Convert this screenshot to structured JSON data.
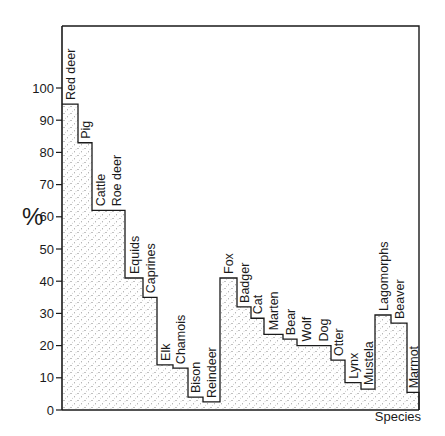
{
  "chart_data": {
    "type": "bar",
    "style": "stepped histogram (adjacent bars, stippled fill)",
    "title": "",
    "xlabel": "Species",
    "ylabel": "%",
    "ylim": [
      0,
      100
    ],
    "yticks": [
      0,
      10,
      20,
      30,
      40,
      50,
      60,
      70,
      80,
      90,
      100
    ],
    "grid": false,
    "legend": null,
    "categories": [
      "Red deer",
      "Pig",
      "Cattle",
      "Roe deer",
      "Equids",
      "Caprines",
      "Elk",
      "Chamois",
      "Bison",
      "Reindeer",
      "Fox",
      "Badger",
      "Cat",
      "Marten",
      "Bear",
      "Wolf",
      "Dog",
      "Otter",
      "Lynx",
      "Mustela",
      "Lagomorphs",
      "Beaver",
      "Marmot"
    ],
    "values": [
      95,
      83,
      62,
      62,
      41,
      35,
      14,
      13,
      4,
      2.5,
      41,
      32,
      28.5,
      23.5,
      22,
      20,
      20,
      15.5,
      8.5,
      6.5,
      29.5,
      27,
      5.5
    ],
    "bar_edges_px": [
      62,
      78,
      92,
      108,
      125,
      143,
      157,
      173,
      188,
      203,
      220,
      237,
      251,
      264,
      283,
      297,
      315,
      331,
      345,
      361,
      375,
      391,
      407,
      419
    ]
  },
  "colors": {
    "line": "#1a1a1a",
    "stipple": "#6e6e6e",
    "background": "#ffffff"
  }
}
